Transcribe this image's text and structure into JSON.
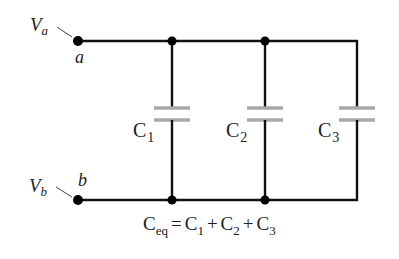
{
  "diagram": {
    "type": "parallel-capacitor-circuit",
    "terminals": {
      "a": {
        "node_label": "a",
        "voltage_main": "V",
        "voltage_sub": "a"
      },
      "b": {
        "node_label": "b",
        "voltage_main": "V",
        "voltage_sub": "b"
      }
    },
    "capacitors": [
      {
        "id": "C1",
        "main": "C",
        "sub": "1"
      },
      {
        "id": "C2",
        "main": "C",
        "sub": "2"
      },
      {
        "id": "C3",
        "main": "C",
        "sub": "3"
      }
    ],
    "equation": {
      "lhs_main": "C",
      "lhs_sub": "eq",
      "equals": "=",
      "terms": [
        {
          "main": "C",
          "sub": "1"
        },
        {
          "main": "C",
          "sub": "2"
        },
        {
          "main": "C",
          "sub": "3"
        }
      ],
      "plus": "+"
    },
    "colors": {
      "wire": "#111111",
      "plate": "#a8a8a8",
      "text": "#222222"
    }
  }
}
